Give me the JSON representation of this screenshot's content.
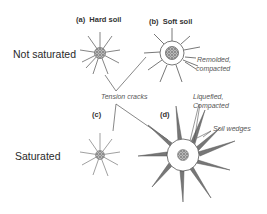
{
  "rows": {
    "top": "Not saturated",
    "bottom": "Saturated"
  },
  "panels": {
    "a": {
      "tag": "(a)",
      "title": "Hard soil"
    },
    "b": {
      "tag": "(b)",
      "title": "Soft soil"
    },
    "c": {
      "tag": "(c)",
      "title": ""
    },
    "d": {
      "tag": "(d)",
      "title": ""
    }
  },
  "annotations": {
    "remolded": [
      "Remolded,",
      "compacted"
    ],
    "tension": "Tension cracks",
    "liquefied": [
      "Liquefied,",
      "Compacted"
    ],
    "wedges": "Soil wedges"
  },
  "colors": {
    "line": "#555555",
    "core": "#888888",
    "text": "#333333"
  }
}
